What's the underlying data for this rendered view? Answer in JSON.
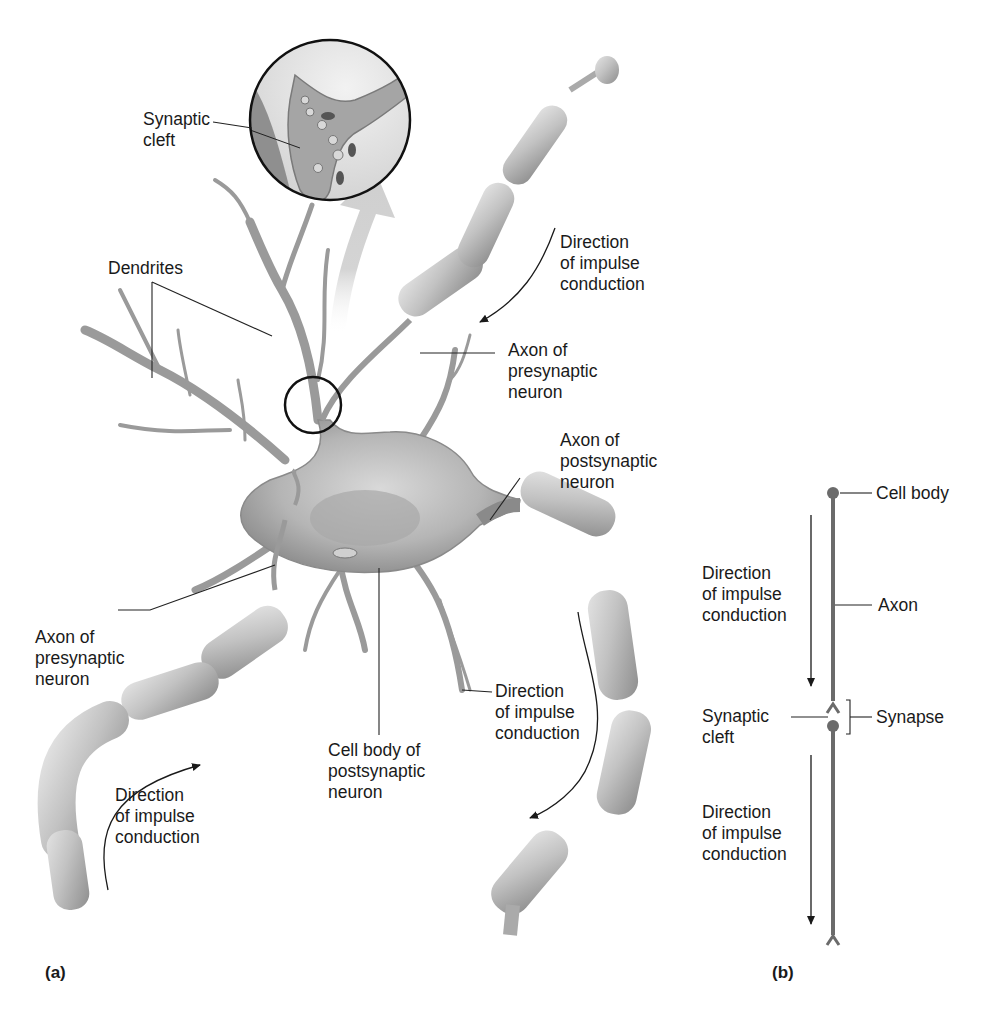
{
  "figure": {
    "panel_a": {
      "label": "(a)",
      "labels": {
        "synaptic_cleft": "Synaptic\ncleft",
        "dendrites": "Dendrites",
        "direction_top": "Direction\nof impulse\nconduction",
        "axon_presynaptic_top": "Axon of\npresynaptic\nneuron",
        "axon_postsynaptic": "Axon of\npostsynaptic\nneuron",
        "axon_presynaptic_left": "Axon of\npresynaptic\nneuron",
        "direction_right": "Direction\nof impulse\nconduction",
        "cell_body_postsynaptic": "Cell body of\npostsynaptic\nneuron",
        "direction_bottom_left": "Direction\nof impulse\nconduction"
      }
    },
    "panel_b": {
      "label": "(b)",
      "labels": {
        "cell_body": "Cell body",
        "direction_upper": "Direction\nof impulse\nconduction",
        "axon": "Axon",
        "synaptic_cleft": "Synaptic\ncleft",
        "synapse": "Synapse",
        "direction_lower": "Direction\nof impulse\nconduction"
      }
    },
    "colors": {
      "text": "#1a1a1a",
      "leader_line": "#222222",
      "neuron_fill": "#b9b9b9",
      "neuron_dark": "#7a7a7a",
      "myelin_fill": "#c4c4c4",
      "schematic_axon": "#6b6b6b",
      "highlight_arrow": "#d6d6d6"
    }
  }
}
